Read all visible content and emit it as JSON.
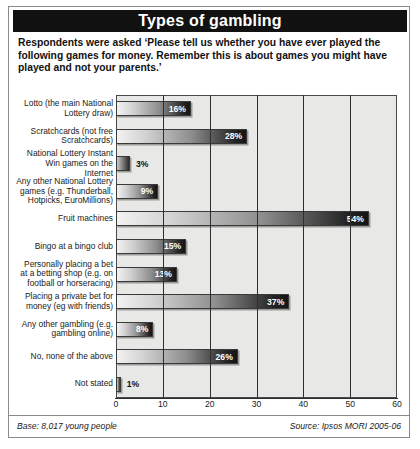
{
  "title": "Types of gambling",
  "intro": "Respondents were asked ‘Please tell us whether you have ever played the following games for money. Remember this is about games you might have played and not your parents.’",
  "footer": {
    "base": "Base: 8,017 young people",
    "source": "Source: Ipsos MORI 2005-06"
  },
  "chart_data": {
    "type": "bar",
    "orientation": "horizontal",
    "title": "Types of gambling",
    "xlabel": "",
    "ylabel": "",
    "xlim": [
      0,
      60
    ],
    "xticks": [
      0,
      10,
      20,
      30,
      40,
      50,
      60
    ],
    "xtick_labels": [
      "0",
      "10",
      "20",
      "30",
      "40",
      "50",
      "60"
    ],
    "grid": true,
    "legend": false,
    "value_suffix": "%",
    "categories": [
      "Lotto (the main National Lottery draw)",
      "Scratchcards (not free Scratchcards)",
      "National Lottery Instant Win games on the Internet",
      "Any other National Lottery games (e.g. Thunderball, Hotpicks, EuroMillions)",
      "Fruit machines",
      "Bingo at a bingo club",
      "Personally placing a bet at a betting shop (e.g. on football or horseracing)",
      "Placing a private bet for money (eg with friends)",
      "Any other gambling (e.g. gambling online)",
      "No, none of the above",
      "Not stated"
    ],
    "values": [
      16,
      28,
      3,
      9,
      54,
      15,
      13,
      37,
      8,
      26,
      1
    ],
    "value_labels": [
      "16%",
      "28%",
      "3%",
      "9%",
      "54%",
      "15%",
      "13%",
      "37%",
      "8%",
      "26%",
      "1%"
    ],
    "label_placement": [
      "inside",
      "inside",
      "outside",
      "inside",
      "inside",
      "inside",
      "inside",
      "inside",
      "inside",
      "inside",
      "outside"
    ]
  }
}
